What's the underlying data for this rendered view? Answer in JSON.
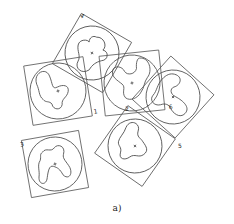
{
  "figure": {
    "caption": "a)",
    "parts": [
      {
        "id": "part-4",
        "label": "4",
        "cx": 92,
        "cy": 53,
        "angle": 30,
        "size": 58
      },
      {
        "id": "part-1",
        "label": "1",
        "cx": 58,
        "cy": 91,
        "angle": -9,
        "size": 60
      },
      {
        "id": "part-6",
        "label": "6",
        "cx": 132,
        "cy": 83,
        "angle": -6,
        "size": 60
      },
      {
        "id": "part-5",
        "label": "5",
        "cx": 173,
        "cy": 97,
        "angle": 42,
        "size": 58
      },
      {
        "id": "part-2",
        "label": "2",
        "cx": 135,
        "cy": 146,
        "angle": 35,
        "size": 58
      },
      {
        "id": "part-3",
        "label": "3",
        "cx": 55,
        "cy": 164,
        "angle": -10,
        "size": 58
      }
    ]
  }
}
